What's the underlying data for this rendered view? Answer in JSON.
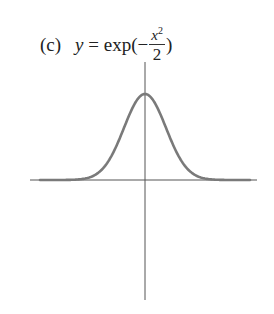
{
  "title": {
    "label": "(c)",
    "lhs": "y",
    "eq": " = exp(−",
    "num_var": "x",
    "num_exp": "2",
    "den": "2",
    "close": ")"
  },
  "chart_data": {
    "type": "line",
    "function": "exp(-x^2/2)",
    "xlabel": "",
    "ylabel": "",
    "xlim": [
      -5,
      5
    ],
    "ylim": [
      0,
      1
    ],
    "grid": false,
    "legend": null,
    "axes": "centered at origin, no ticks",
    "series": [
      {
        "name": "y = exp(-x^2/2)",
        "color": "#777777",
        "x": [
          -5,
          -4,
          -3,
          -2.5,
          -2,
          -1.5,
          -1,
          -0.5,
          0,
          0.5,
          1,
          1.5,
          2,
          2.5,
          3,
          4,
          5
        ],
        "values": [
          0.0,
          0.0003,
          0.0111,
          0.0439,
          0.1353,
          0.3247,
          0.6065,
          0.8825,
          1.0,
          0.8825,
          0.6065,
          0.3247,
          0.1353,
          0.0439,
          0.0111,
          0.0003,
          0.0
        ]
      }
    ],
    "peak": {
      "x": 0,
      "y": 1
    }
  },
  "colors": {
    "axis": "#555555",
    "curve": "#7a7a7a",
    "text": "#222222"
  }
}
